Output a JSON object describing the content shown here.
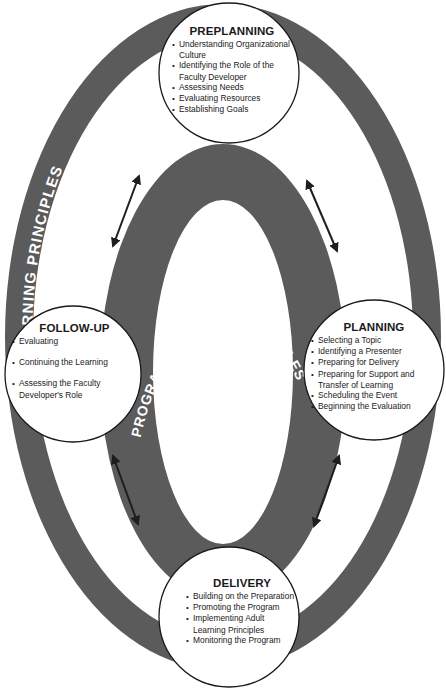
{
  "diagram": {
    "outer_ring": {
      "label": "ADULT LEARNING PRINCIPLES",
      "color": "#5a5a5a"
    },
    "inner_ring": {
      "label": "PROGRAM PLANNING PRINCIPLES",
      "color": "#5a5a5a"
    },
    "stages": [
      {
        "id": "preplanning",
        "title": "PREPLANNING",
        "items": [
          "Understanding Organizational Culture",
          "Identifying the Role of the Faculty Developer",
          "Assessing Needs",
          "Evaluating Resources",
          "Establishing Goals"
        ]
      },
      {
        "id": "planning",
        "title": "PLANNING",
        "items": [
          "Selecting a Topic",
          "Identifying a Presenter",
          "Preparing for Delivery",
          "Preparing for Support and Transfer of Learning",
          "Scheduling the Event",
          "Beginning the Evaluation"
        ]
      },
      {
        "id": "delivery",
        "title": "DELIVERY",
        "items": [
          "Building on the Preparation",
          "Promoting the Program",
          "Implementing Adult Learning Principles",
          "Monitoring the Program"
        ]
      },
      {
        "id": "follow-up",
        "title": "FOLLOW-UP",
        "items": [
          "Evaluating",
          "Continuing the Learning",
          "Assessing the Faculty Developer's Role"
        ]
      }
    ],
    "connectors": [
      {
        "from": "preplanning",
        "to": "follow-up",
        "type": "double-arrow"
      },
      {
        "from": "preplanning",
        "to": "planning",
        "type": "double-arrow"
      },
      {
        "from": "follow-up",
        "to": "delivery",
        "type": "double-arrow"
      },
      {
        "from": "planning",
        "to": "delivery",
        "type": "double-arrow"
      }
    ]
  }
}
